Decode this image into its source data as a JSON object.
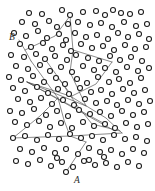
{
  "figure": {
    "type": "scatter-network",
    "title": "",
    "background_color": "#ffffff",
    "node_color": "#ffffff",
    "node_stroke_color": "#1a1a1a",
    "path_color": "#4a4a4a",
    "label_color": "#2a2a2a",
    "width": 155,
    "height": 191
  },
  "labels": [
    {
      "text": "B",
      "x": 9,
      "y": 38
    },
    {
      "text": "A",
      "x": 74,
      "y": 181
    }
  ],
  "chart_data": {
    "type": "scatter",
    "title": "",
    "xlabel": "",
    "ylabel": "",
    "xlim": [
      0,
      155
    ],
    "ylim": [
      0,
      191
    ],
    "grid": false,
    "legend": "none",
    "node_radius": 2.5,
    "nodes": [
      [
        29,
        13
      ],
      [
        42,
        14
      ],
      [
        62,
        10
      ],
      [
        70,
        15
      ],
      [
        83,
        12
      ],
      [
        96,
        11
      ],
      [
        105,
        15
      ],
      [
        113,
        10
      ],
      [
        121,
        13
      ],
      [
        130,
        14
      ],
      [
        141,
        12
      ],
      [
        22,
        22
      ],
      [
        35,
        24
      ],
      [
        49,
        21
      ],
      [
        57,
        27
      ],
      [
        68,
        24
      ],
      [
        78,
        22
      ],
      [
        90,
        25
      ],
      [
        101,
        23
      ],
      [
        112,
        27
      ],
      [
        124,
        22
      ],
      [
        136,
        26
      ],
      [
        147,
        24
      ],
      [
        14,
        33
      ],
      [
        26,
        36
      ],
      [
        38,
        31
      ],
      [
        47,
        38
      ],
      [
        59,
        34
      ],
      [
        66,
        40
      ],
      [
        75,
        33
      ],
      [
        86,
        37
      ],
      [
        97,
        35
      ],
      [
        108,
        39
      ],
      [
        118,
        33
      ],
      [
        128,
        37
      ],
      [
        139,
        34
      ],
      [
        149,
        39
      ],
      [
        20,
        44
      ],
      [
        31,
        47
      ],
      [
        43,
        43
      ],
      [
        52,
        49
      ],
      [
        63,
        45
      ],
      [
        71,
        51
      ],
      [
        81,
        44
      ],
      [
        92,
        48
      ],
      [
        103,
        46
      ],
      [
        114,
        50
      ],
      [
        125,
        45
      ],
      [
        135,
        49
      ],
      [
        146,
        47
      ],
      [
        11,
        55
      ],
      [
        24,
        57
      ],
      [
        36,
        54
      ],
      [
        45,
        59
      ],
      [
        55,
        56
      ],
      [
        67,
        60
      ],
      [
        76,
        55
      ],
      [
        88,
        58
      ],
      [
        99,
        61
      ],
      [
        110,
        56
      ],
      [
        120,
        60
      ],
      [
        131,
        57
      ],
      [
        142,
        61
      ],
      [
        16,
        66
      ],
      [
        28,
        69
      ],
      [
        40,
        65
      ],
      [
        50,
        71
      ],
      [
        61,
        67
      ],
      [
        72,
        72
      ],
      [
        83,
        66
      ],
      [
        94,
        70
      ],
      [
        105,
        68
      ],
      [
        116,
        72
      ],
      [
        127,
        67
      ],
      [
        138,
        71
      ],
      [
        149,
        68
      ],
      [
        9,
        77
      ],
      [
        21,
        80
      ],
      [
        33,
        76
      ],
      [
        44,
        82
      ],
      [
        56,
        78
      ],
      [
        65,
        84
      ],
      [
        77,
        79
      ],
      [
        87,
        83
      ],
      [
        98,
        77
      ],
      [
        109,
        82
      ],
      [
        119,
        79
      ],
      [
        130,
        83
      ],
      [
        141,
        78
      ],
      [
        13,
        88
      ],
      [
        25,
        91
      ],
      [
        37,
        87
      ],
      [
        48,
        93
      ],
      [
        58,
        89
      ],
      [
        69,
        94
      ],
      [
        80,
        88
      ],
      [
        91,
        92
      ],
      [
        101,
        90
      ],
      [
        112,
        94
      ],
      [
        123,
        89
      ],
      [
        134,
        93
      ],
      [
        145,
        90
      ],
      [
        18,
        99
      ],
      [
        30,
        102
      ],
      [
        41,
        98
      ],
      [
        52,
        104
      ],
      [
        63,
        100
      ],
      [
        74,
        105
      ],
      [
        85,
        99
      ],
      [
        96,
        103
      ],
      [
        107,
        101
      ],
      [
        117,
        105
      ],
      [
        128,
        100
      ],
      [
        139,
        104
      ],
      [
        150,
        101
      ],
      [
        10,
        111
      ],
      [
        22,
        113
      ],
      [
        34,
        109
      ],
      [
        46,
        115
      ],
      [
        57,
        111
      ],
      [
        68,
        116
      ],
      [
        79,
        110
      ],
      [
        90,
        114
      ],
      [
        100,
        112
      ],
      [
        111,
        116
      ],
      [
        122,
        111
      ],
      [
        133,
        115
      ],
      [
        144,
        112
      ],
      [
        15,
        122
      ],
      [
        27,
        125
      ],
      [
        39,
        121
      ],
      [
        50,
        127
      ],
      [
        61,
        123
      ],
      [
        72,
        128
      ],
      [
        83,
        122
      ],
      [
        94,
        126
      ],
      [
        105,
        124
      ],
      [
        115,
        128
      ],
      [
        126,
        123
      ],
      [
        137,
        127
      ],
      [
        148,
        124
      ],
      [
        13,
        138
      ],
      [
        25,
        136
      ],
      [
        37,
        140
      ],
      [
        48,
        135
      ],
      [
        59,
        139
      ],
      [
        70,
        134
      ],
      [
        81,
        138
      ],
      [
        92,
        136
      ],
      [
        103,
        140
      ],
      [
        114,
        135
      ],
      [
        125,
        139
      ],
      [
        136,
        137
      ],
      [
        147,
        141
      ],
      [
        20,
        149
      ],
      [
        32,
        152
      ],
      [
        44,
        148
      ],
      [
        55,
        153
      ],
      [
        66,
        149
      ],
      [
        78,
        154
      ],
      [
        89,
        148
      ],
      [
        100,
        152
      ],
      [
        111,
        150
      ],
      [
        122,
        154
      ],
      [
        133,
        149
      ],
      [
        144,
        153
      ],
      [
        16,
        161
      ],
      [
        28,
        164
      ],
      [
        40,
        160
      ],
      [
        51,
        166
      ],
      [
        62,
        162
      ],
      [
        73,
        167
      ],
      [
        84,
        161
      ],
      [
        95,
        165
      ],
      [
        106,
        163
      ],
      [
        117,
        167
      ],
      [
        128,
        162
      ],
      [
        139,
        166
      ],
      [
        66,
        172
      ],
      [
        57,
        158
      ],
      [
        89,
        160
      ],
      [
        104,
        157
      ]
    ],
    "paths": [
      {
        "name": "path-b-start",
        "points": [
          [
            19,
            40
          ],
          [
            25,
            50
          ],
          [
            31,
            61
          ]
        ]
      },
      {
        "name": "path-b-branch",
        "points": [
          [
            25,
            50
          ],
          [
            55,
            36
          ],
          [
            70,
            16
          ]
        ]
      },
      {
        "name": "path-upper-v",
        "points": [
          [
            70,
            16
          ],
          [
            73,
            50
          ],
          [
            70,
            72
          ]
        ]
      },
      {
        "name": "path-upper-right",
        "points": [
          [
            73,
            50
          ],
          [
            112,
            62
          ]
        ]
      },
      {
        "name": "path-right-down",
        "points": [
          [
            112,
            62
          ],
          [
            96,
            84
          ],
          [
            72,
            96
          ]
        ]
      },
      {
        "name": "path-mid-left-fan-1",
        "points": [
          [
            27,
            82
          ],
          [
            70,
            96
          ]
        ]
      },
      {
        "name": "path-mid-left-fan-2",
        "points": [
          [
            27,
            82
          ],
          [
            86,
            106
          ]
        ]
      },
      {
        "name": "path-mid-left-fan-3",
        "points": [
          [
            27,
            82
          ],
          [
            105,
            124
          ]
        ]
      },
      {
        "name": "path-mid-left-fan-4",
        "points": [
          [
            27,
            82
          ],
          [
            115,
            131
          ]
        ]
      },
      {
        "name": "path-center-diag-1",
        "points": [
          [
            45,
            59
          ],
          [
            60,
            80
          ],
          [
            72,
            96
          ]
        ]
      },
      {
        "name": "path-center-diag-2",
        "points": [
          [
            60,
            80
          ],
          [
            76,
            104
          ],
          [
            92,
            124
          ]
        ]
      },
      {
        "name": "path-center-cross-1",
        "points": [
          [
            92,
            124
          ],
          [
            120,
            131
          ]
        ]
      },
      {
        "name": "path-center-cross-2",
        "points": [
          [
            70,
            96
          ],
          [
            106,
            118
          ],
          [
            122,
            133
          ]
        ]
      },
      {
        "name": "path-long-horizontal",
        "points": [
          [
            13,
            138
          ],
          [
            70,
            136
          ],
          [
            122,
            133
          ]
        ]
      },
      {
        "name": "path-lower-left-diag",
        "points": [
          [
            13,
            138
          ],
          [
            40,
            116
          ],
          [
            58,
            98
          ]
        ]
      },
      {
        "name": "path-a-tail",
        "points": [
          [
            66,
            172
          ],
          [
            78,
            154
          ],
          [
            86,
            142
          ]
        ]
      },
      {
        "name": "path-a-link",
        "points": [
          [
            86,
            142
          ],
          [
            70,
            136
          ]
        ]
      },
      {
        "name": "path-steep-center",
        "points": [
          [
            58,
            98
          ],
          [
            64,
            120
          ],
          [
            70,
            136
          ]
        ]
      },
      {
        "name": "path-upper-mid-join",
        "points": [
          [
            70,
            72
          ],
          [
            86,
            106
          ]
        ]
      },
      {
        "name": "path-left-mid-join",
        "points": [
          [
            31,
            61
          ],
          [
            58,
            98
          ]
        ]
      }
    ]
  }
}
